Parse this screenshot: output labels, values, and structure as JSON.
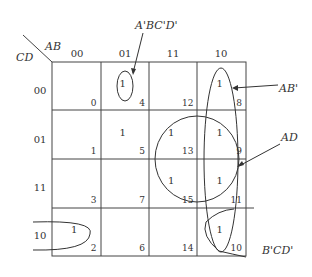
{
  "kmap": {
    "row_var": "CD",
    "col_var": "AB",
    "col_labels": [
      "00",
      "01",
      "11",
      "10"
    ],
    "row_labels": [
      "00",
      "01",
      "11",
      "10"
    ],
    "cells": [
      [
        {
          "value": "",
          "index": "0"
        },
        {
          "value": "1",
          "index": "4"
        },
        {
          "value": "",
          "index": "12"
        },
        {
          "value": "1",
          "index": "8"
        }
      ],
      [
        {
          "value": "",
          "index": "1"
        },
        {
          "value": "1",
          "index": "5"
        },
        {
          "value": "1",
          "index": "13"
        },
        {
          "value": "1",
          "index": "9"
        }
      ],
      [
        {
          "value": "",
          "index": "3"
        },
        {
          "value": "",
          "index": "7"
        },
        {
          "value": "1",
          "index": "15"
        },
        {
          "value": "1",
          "index": "11"
        }
      ],
      [
        {
          "value": "1",
          "index": "2"
        },
        {
          "value": "",
          "index": "6"
        },
        {
          "value": "",
          "index": "14"
        },
        {
          "value": "1",
          "index": "10"
        }
      ]
    ]
  },
  "groups": [
    {
      "name": "A'BC'D'",
      "cells": [
        4
      ]
    },
    {
      "name": "AB'",
      "cells": [
        8,
        9,
        11,
        10
      ]
    },
    {
      "name": "AD",
      "cells": [
        13,
        9,
        15,
        11
      ]
    },
    {
      "name": "B'CD'",
      "cells": [
        2,
        10
      ]
    }
  ]
}
